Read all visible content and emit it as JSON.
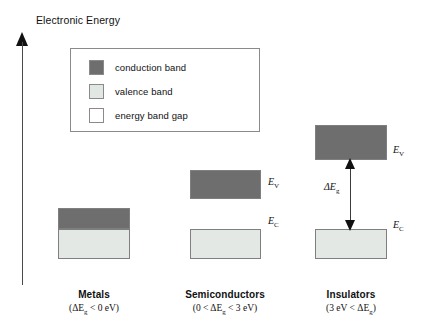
{
  "axis": {
    "label": "Electronic Energy",
    "icon": "up-arrow-icon"
  },
  "legend": {
    "items": [
      {
        "label": "conduction band",
        "color": "#6e6e6e",
        "swatch_name": "conduction-band-swatch"
      },
      {
        "label": "valence band",
        "color": "#e1e7e3",
        "swatch_name": "valence-band-swatch"
      },
      {
        "label": "energy band gap",
        "color": "#ffffff",
        "swatch_name": "energy-band-gap-swatch"
      }
    ]
  },
  "columns": [
    {
      "key": "metals",
      "title": "Metals",
      "condition": "(ΔEg < 0 eV)",
      "condition_prefix": "(ΔE",
      "condition_sub": "g",
      "condition_suffix": " < 0 eV)",
      "bands": {
        "conduction_label": "",
        "valence_label": ""
      },
      "gap": null
    },
    {
      "key": "semiconductors",
      "title": "Semiconductors",
      "condition": "(0 < ΔEg < 3 eV)",
      "condition_prefix": "(0 < ΔE",
      "condition_sub": "g",
      "condition_suffix": " < 3 eV)",
      "bands": {
        "conduction_label": "E",
        "conduction_sub": "V",
        "valence_label": "E",
        "valence_sub": "C"
      },
      "gap": null
    },
    {
      "key": "insulators",
      "title": "Insulators",
      "condition": "(3 eV < ΔEg)",
      "condition_prefix": "(3 eV < ΔE",
      "condition_sub": "g",
      "condition_suffix": ")",
      "bands": {
        "conduction_label": "E",
        "conduction_sub": "V",
        "valence_label": "E",
        "valence_sub": "C"
      },
      "gap": {
        "label_prefix": "ΔE",
        "label_sub": "g"
      }
    }
  ],
  "colors": {
    "conduction_band": "#6e6e6e",
    "valence_band": "#e3e8e4",
    "band_border": "#7f7f7f",
    "axis": "#4a4a4a",
    "text": "#111111",
    "legend_border": "#8a8a8a",
    "background": "#ffffff"
  }
}
